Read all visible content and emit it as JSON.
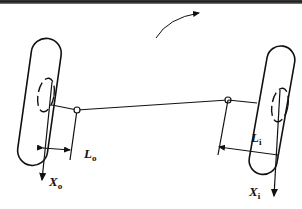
{
  "diagram": {
    "type": "steering-linkage",
    "labels": {
      "outer_offset": {
        "main": "L",
        "sub": "o"
      },
      "inner_offset": {
        "main": "L",
        "sub": "i"
      },
      "outer_axis": {
        "main": "X",
        "sub": "o"
      },
      "inner_axis": {
        "main": "X",
        "sub": "i"
      }
    },
    "elements": [
      "left-wheel",
      "right-wheel",
      "tie-rod",
      "left-kingpin-ellipse",
      "right-kingpin-ellipse",
      "rotation-arrow"
    ],
    "colors": {
      "stroke": "#111111",
      "background": "#ffffff",
      "topbar": "#2a2a2a"
    }
  }
}
